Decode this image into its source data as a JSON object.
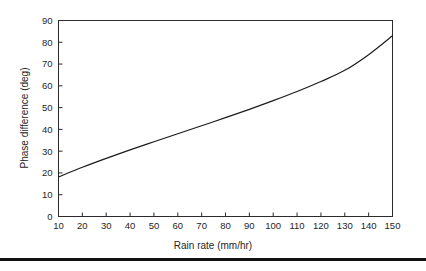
{
  "figure": {
    "background_color": "#ffffff",
    "ink_color": "#1a1a1a",
    "page_rule_color": "#111111"
  },
  "chart_data": {
    "type": "line",
    "title": "",
    "subtitle": "",
    "xlabel": "Rain rate (mm/hr)",
    "ylabel": "Phase difference (deg)",
    "xlim": [
      10,
      150
    ],
    "ylim": [
      0,
      90
    ],
    "xticks": [
      10,
      20,
      30,
      40,
      50,
      60,
      70,
      80,
      90,
      100,
      110,
      120,
      130,
      140,
      150
    ],
    "yticks": [
      0,
      10,
      20,
      30,
      40,
      50,
      60,
      70,
      80,
      90
    ],
    "xtick_labels": [
      "10",
      "20",
      "30",
      "40",
      "50",
      "60",
      "70",
      "80",
      "90",
      "100",
      "110",
      "120",
      "130",
      "140",
      "150"
    ],
    "ytick_labels": [
      "0",
      "10",
      "20",
      "30",
      "40",
      "50",
      "60",
      "70",
      "80",
      "90"
    ],
    "grid": false,
    "legend": false,
    "legend_position": "none",
    "frame": true,
    "tick_direction": "in",
    "series": [
      {
        "name": "Phase difference vs rain rate",
        "color": "#1a1a1a",
        "x": [
          10,
          20,
          30,
          40,
          50,
          60,
          70,
          80,
          90,
          100,
          110,
          120,
          130,
          140,
          150
        ],
        "values": [
          18.2,
          22.6,
          26.7,
          30.6,
          34.3,
          38.0,
          41.7,
          45.4,
          49.2,
          53.2,
          57.4,
          62.0,
          67.1,
          74.3,
          83.0
        ]
      }
    ]
  }
}
